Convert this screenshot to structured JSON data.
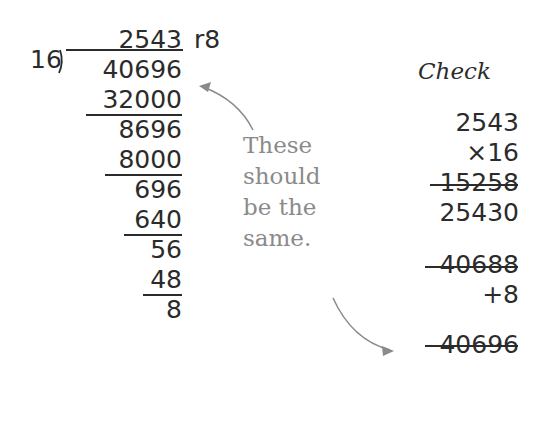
{
  "division": {
    "quotient": "2543",
    "remainder_label": "r8",
    "divisor": "16",
    "dividend": "40696",
    "steps": [
      "32000",
      "8696",
      "8000",
      "696",
      "640",
      "56",
      "48",
      "8"
    ]
  },
  "note": {
    "lines": [
      "These",
      "should",
      "be the",
      "same."
    ]
  },
  "check": {
    "title": "Check",
    "rows": [
      "2543",
      "×16",
      "15258",
      "25430",
      "40688",
      "+8",
      "40696"
    ]
  },
  "colors": {
    "text": "#2b2b2b",
    "note": "#8a8a8a"
  }
}
